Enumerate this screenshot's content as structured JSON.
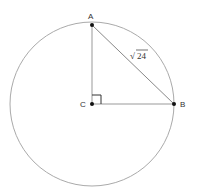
{
  "diagram": {
    "type": "geometry",
    "points": {
      "A": {
        "label": "A"
      },
      "B": {
        "label": "B"
      },
      "C": {
        "label": "C"
      }
    },
    "segments": [
      {
        "from": "C",
        "to": "A"
      },
      {
        "from": "C",
        "to": "B"
      },
      {
        "from": "A",
        "to": "B",
        "label": "√24"
      }
    ],
    "right_angle_at": "C",
    "chord_label_radical": "√",
    "chord_label_value": "24"
  }
}
